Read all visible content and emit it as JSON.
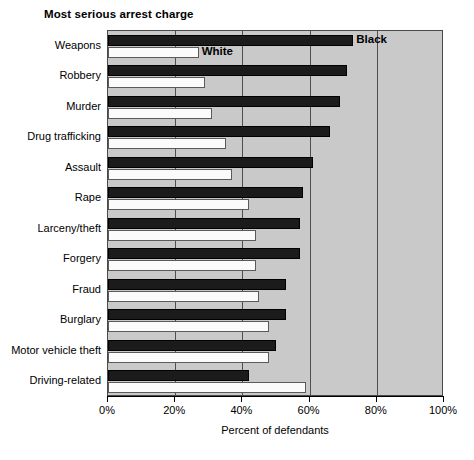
{
  "chart_data": {
    "type": "bar",
    "orientation": "horizontal",
    "title": "Most serious arrest charge",
    "xlabel": "Percent of defendants",
    "ylabel": "",
    "xlim": [
      0,
      100
    ],
    "xticks": [
      0,
      20,
      40,
      60,
      80,
      100
    ],
    "xticklabels": [
      "0%",
      "20%",
      "40%",
      "60%",
      "80%",
      "100%"
    ],
    "grid": true,
    "grid_axis": "x",
    "legend": "direct-labels",
    "legend_position": "inside-top",
    "plot_background": "#c9c9c9",
    "categories": [
      "Weapons",
      "Robbery",
      "Murder",
      "Drug trafficking",
      "Assault",
      "Rape",
      "Larceny/theft",
      "Forgery",
      "Fraud",
      "Burglary",
      "Motor vehicle theft",
      "Driving-related"
    ],
    "series": [
      {
        "name": "Black",
        "color": "#1b1b1b",
        "values": [
          73,
          71,
          69,
          66,
          61,
          58,
          57,
          57,
          53,
          53,
          50,
          42
        ]
      },
      {
        "name": "White",
        "color": "#fbfbfb",
        "values": [
          27,
          29,
          31,
          35,
          37,
          42,
          44,
          44,
          45,
          48,
          48,
          59
        ]
      }
    ]
  }
}
